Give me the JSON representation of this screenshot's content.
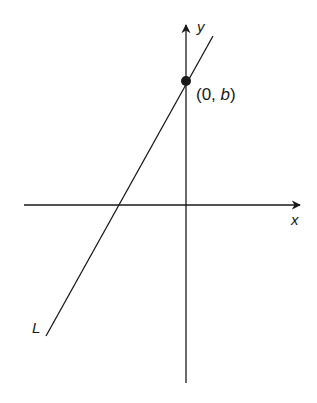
{
  "diagram": {
    "axes": {
      "x_label": "x",
      "y_label": "y"
    },
    "line": {
      "label": "L"
    },
    "point": {
      "label_open": "(0, ",
      "label_var": "b",
      "label_close": ")"
    },
    "colors": {
      "stroke": "#1a1a1a",
      "background": "#ffffff"
    }
  }
}
